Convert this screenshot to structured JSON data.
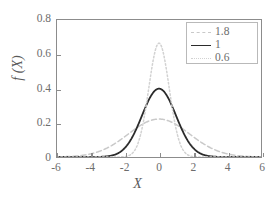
{
  "chart_data": {
    "type": "line",
    "title": "",
    "xlabel": "X",
    "ylabel": "f (X)",
    "xlim": [
      -6,
      6
    ],
    "ylim": [
      0,
      0.8
    ],
    "xticks": [
      "-6",
      "-4",
      "-2",
      "0",
      "2",
      "4",
      "6"
    ],
    "xtick_values": [
      -6,
      -4,
      -2,
      0,
      2,
      4,
      6
    ],
    "yticks": [
      "0",
      "0.2",
      "0.4",
      "0.6",
      "0.8"
    ],
    "ytick_values": [
      0,
      0.2,
      0.4,
      0.6,
      0.8
    ],
    "grid": false,
    "legend_position": "top-right",
    "legend_title": "",
    "x": [
      -6,
      -5.5,
      -5,
      -4.5,
      -4,
      -3.5,
      -3,
      -2.5,
      -2,
      -1.5,
      -1,
      -0.5,
      0,
      0.5,
      1,
      1.5,
      2,
      2.5,
      3,
      3.5,
      4,
      4.5,
      5,
      5.5,
      6
    ],
    "series": [
      {
        "name": "1.8",
        "sigma": 1.8,
        "peak": 0.2216,
        "style": "dashed",
        "color": "#c9c9c9",
        "values": [
          0.0023,
          0.0049,
          0.0095,
          0.0171,
          0.0286,
          0.0444,
          0.0642,
          0.0862,
          0.1077,
          0.1252,
          0.1362,
          0.1399,
          0.2216,
          0.1399,
          0.1362,
          0.1252,
          0.1077,
          0.0862,
          0.0642,
          0.0444,
          0.0286,
          0.0171,
          0.0095,
          0.0049,
          0.0023
        ]
      },
      {
        "name": "1",
        "sigma": 1.0,
        "peak": 0.3989,
        "style": "solid",
        "color": "#2b2b2b",
        "values": [
          0.0,
          0.0001,
          0.0,
          0.0,
          0.0001,
          0.0009,
          0.0044,
          0.0175,
          0.054,
          0.1295,
          0.242,
          0.3521,
          0.3989,
          0.3521,
          0.242,
          0.1295,
          0.054,
          0.0175,
          0.0044,
          0.0009,
          0.0001,
          0.0,
          0.0,
          0.0,
          0.0
        ]
      },
      {
        "name": "0.6",
        "sigma": 0.6,
        "peak": 0.6649,
        "style": "dotted",
        "color": "#d2d2d2",
        "values": [
          0.0,
          0.0,
          0.0,
          0.0,
          0.0,
          0.0,
          0.0,
          0.0001,
          0.0027,
          0.0314,
          0.1644,
          0.391,
          0.6649,
          0.391,
          0.1644,
          0.0314,
          0.0027,
          0.0001,
          0.0,
          0.0,
          0.0,
          0.0,
          0.0,
          0.0,
          0.0
        ]
      }
    ]
  },
  "axes": {
    "xlabel": "X",
    "ylabel": "f (X)"
  },
  "legend": {
    "items": [
      {
        "label": "1.8"
      },
      {
        "label": "1"
      },
      {
        "label": "0.6"
      }
    ]
  }
}
